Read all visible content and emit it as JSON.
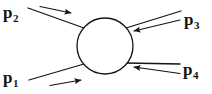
{
  "figure": {
    "type": "feynman-scattering-blob",
    "background_color": "#ffffff",
    "stroke_color": "#141414",
    "label_color": "#141414"
  },
  "blob": {
    "name": "interaction-blob",
    "shape": "circle",
    "cx": 105,
    "cy": 46,
    "r": 28,
    "fill": "#ffffff",
    "stroke": "#141414",
    "stroke_width": 1.3
  },
  "legs": [
    {
      "id": "p1",
      "label": "p",
      "subscript": "1",
      "position": "lower-left",
      "direction": "incoming",
      "arrow_direction": "right",
      "line": {
        "x1": 30,
        "y1": 80,
        "x2": 83,
        "y2": 64
      },
      "arrow": {
        "x1": 50,
        "y1": 85,
        "x2": 82,
        "y2": 79
      }
    },
    {
      "id": "p2",
      "label": "p",
      "subscript": "2",
      "position": "upper-left",
      "direction": "incoming",
      "arrow_direction": "right",
      "line": {
        "x1": 28,
        "y1": 8,
        "x2": 83,
        "y2": 28
      },
      "arrow": {
        "x1": 40,
        "y1": 6,
        "x2": 72,
        "y2": 13
      }
    },
    {
      "id": "p3",
      "label": "p",
      "subscript": "3",
      "position": "upper-right",
      "direction": "incoming",
      "arrow_direction": "left",
      "line": {
        "x1": 181,
        "y1": 11,
        "x2": 127,
        "y2": 28
      },
      "arrow": {
        "x1": 180,
        "y1": 20,
        "x2": 133,
        "y2": 31
      }
    },
    {
      "id": "p4",
      "label": "p",
      "subscript": "4",
      "position": "lower-right",
      "direction": "incoming",
      "arrow_direction": "left",
      "line": {
        "x1": 180,
        "y1": 64,
        "x2": 127,
        "y2": 63
      },
      "arrow": {
        "x1": 180,
        "y1": 73,
        "x2": 133,
        "y2": 67
      }
    }
  ],
  "labels": {
    "p1": {
      "base": "p",
      "sub": "1"
    },
    "p2": {
      "base": "p",
      "sub": "2"
    },
    "p3": {
      "base": "p",
      "sub": "3"
    },
    "p4": {
      "base": "p",
      "sub": "4"
    }
  }
}
